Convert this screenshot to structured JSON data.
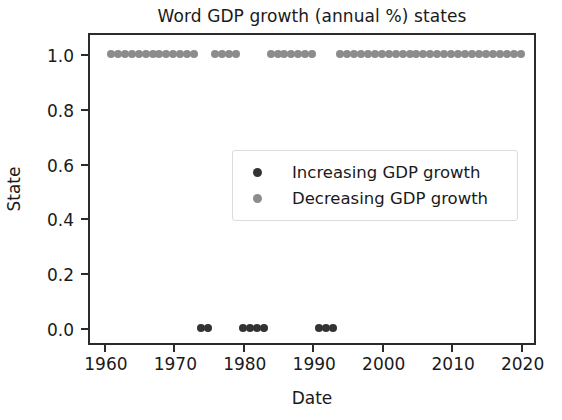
{
  "chart_data": {
    "type": "scatter",
    "title": "Word GDP growth (annual %) states",
    "xlabel": "Date",
    "ylabel": "State",
    "xlim": [
      1958,
      2022.5
    ],
    "ylim": [
      -0.07,
      1.07
    ],
    "grid": false,
    "legend_position": "center",
    "xticks": [
      1960,
      1970,
      1980,
      1990,
      2000,
      2010,
      2020
    ],
    "xtick_labels": [
      "1960",
      "1970",
      "1980",
      "1990",
      "2000",
      "2010",
      "2020"
    ],
    "yticks": [
      0.0,
      0.2,
      0.4,
      0.6,
      0.8,
      1.0
    ],
    "ytick_labels": [
      "0.0",
      "0.2",
      "0.4",
      "0.6",
      "0.8",
      "1.0"
    ],
    "colors": {
      "increasing": "#333333",
      "decreasing": "#8c8c8c",
      "axis": "#2b2b2b",
      "text": "#1a1a1a",
      "background": "#ffffff"
    },
    "series": [
      {
        "name": "Increasing GDP growth",
        "color": "#333333",
        "marker": "o",
        "x": [
          1974,
          1975,
          1980,
          1981,
          1982,
          1983,
          1991,
          1992,
          1993
        ],
        "y": [
          0,
          0,
          0,
          0,
          0,
          0,
          0,
          0,
          0
        ]
      },
      {
        "name": "Decreasing GDP growth",
        "color": "#8c8c8c",
        "marker": "o",
        "x": [
          1961,
          1962,
          1963,
          1964,
          1965,
          1966,
          1967,
          1968,
          1969,
          1970,
          1971,
          1972,
          1973,
          1976,
          1977,
          1978,
          1979,
          1984,
          1985,
          1986,
          1987,
          1988,
          1989,
          1990,
          1994,
          1995,
          1996,
          1997,
          1998,
          1999,
          2000,
          2001,
          2002,
          2003,
          2004,
          2005,
          2006,
          2007,
          2008,
          2009,
          2010,
          2011,
          2012,
          2013,
          2014,
          2015,
          2016,
          2017,
          2018,
          2019,
          2020
        ],
        "y": [
          1,
          1,
          1,
          1,
          1,
          1,
          1,
          1,
          1,
          1,
          1,
          1,
          1,
          1,
          1,
          1,
          1,
          1,
          1,
          1,
          1,
          1,
          1,
          1,
          1,
          1,
          1,
          1,
          1,
          1,
          1,
          1,
          1,
          1,
          1,
          1,
          1,
          1,
          1,
          1,
          1,
          1,
          1,
          1,
          1,
          1,
          1,
          1,
          1,
          1,
          1
        ]
      }
    ]
  },
  "legend": {
    "entries": [
      {
        "label": "Increasing GDP growth",
        "style": "inc"
      },
      {
        "label": "Decreasing GDP growth",
        "style": "dec"
      }
    ]
  }
}
